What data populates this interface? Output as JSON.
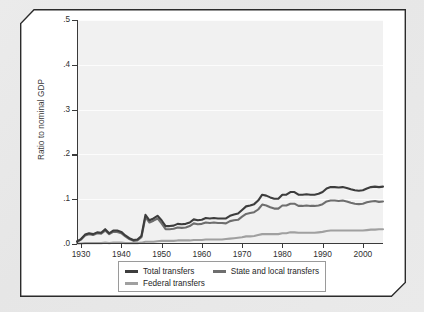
{
  "figure": {
    "ylabel": "Ratio to nominal GDP"
  },
  "legend": {
    "items": [
      {
        "label": "Total transfers",
        "color": "#3d3d3d"
      },
      {
        "label": "State and local transfers",
        "color": "#6e6e6e"
      },
      {
        "label": "Federal transfers",
        "color": "#a0a0a0"
      }
    ]
  },
  "chart_data": {
    "type": "line",
    "title": "",
    "xlabel": "",
    "ylabel": "Ratio to nominal GDP",
    "xlim": [
      1929,
      2005
    ],
    "ylim": [
      0.0,
      0.5
    ],
    "yticks": [
      0.0,
      0.1,
      0.2,
      0.3,
      0.4,
      0.5
    ],
    "ytick_labels": [
      ".0",
      ".1",
      ".2",
      ".3",
      ".4",
      ".5"
    ],
    "xticks": [
      1930,
      1940,
      1950,
      1960,
      1970,
      1980,
      1990,
      2000
    ],
    "xtick_labels": [
      "1930",
      "1940",
      "1950",
      "1960",
      "1970",
      "1980",
      "1990",
      "2000"
    ],
    "grid": true,
    "grid_axis": "y",
    "legend_position": "below",
    "x": [
      1929,
      1930,
      1931,
      1932,
      1933,
      1934,
      1935,
      1936,
      1937,
      1938,
      1939,
      1940,
      1941,
      1942,
      1943,
      1944,
      1945,
      1946,
      1947,
      1948,
      1949,
      1950,
      1951,
      1952,
      1953,
      1954,
      1955,
      1956,
      1957,
      1958,
      1959,
      1960,
      1961,
      1962,
      1963,
      1964,
      1965,
      1966,
      1967,
      1968,
      1969,
      1970,
      1971,
      1972,
      1973,
      1974,
      1975,
      1976,
      1977,
      1978,
      1979,
      1980,
      1981,
      1982,
      1983,
      1984,
      1985,
      1986,
      1987,
      1988,
      1989,
      1990,
      1991,
      1992,
      1993,
      1994,
      1995,
      1996,
      1997,
      1998,
      1999,
      2000,
      2001,
      2002,
      2003,
      2004,
      2005
    ],
    "series": [
      {
        "name": "Total transfers",
        "color": "#3d3d3d",
        "values": [
          0.006,
          0.011,
          0.021,
          0.024,
          0.022,
          0.026,
          0.025,
          0.033,
          0.024,
          0.03,
          0.03,
          0.027,
          0.019,
          0.013,
          0.009,
          0.01,
          0.018,
          0.065,
          0.053,
          0.057,
          0.063,
          0.053,
          0.04,
          0.04,
          0.041,
          0.045,
          0.044,
          0.045,
          0.048,
          0.055,
          0.053,
          0.054,
          0.058,
          0.057,
          0.058,
          0.057,
          0.057,
          0.057,
          0.063,
          0.066,
          0.068,
          0.076,
          0.084,
          0.086,
          0.089,
          0.097,
          0.11,
          0.108,
          0.104,
          0.101,
          0.101,
          0.11,
          0.11,
          0.116,
          0.116,
          0.11,
          0.11,
          0.111,
          0.11,
          0.11,
          0.112,
          0.116,
          0.124,
          0.127,
          0.127,
          0.126,
          0.127,
          0.125,
          0.122,
          0.12,
          0.119,
          0.12,
          0.124,
          0.127,
          0.128,
          0.127,
          0.128
        ]
      },
      {
        "name": "State and local transfers",
        "color": "#6e6e6e",
        "values": [
          0.005,
          0.01,
          0.019,
          0.022,
          0.02,
          0.024,
          0.023,
          0.03,
          0.022,
          0.027,
          0.027,
          0.024,
          0.017,
          0.011,
          0.007,
          0.008,
          0.015,
          0.06,
          0.048,
          0.052,
          0.057,
          0.046,
          0.033,
          0.033,
          0.034,
          0.037,
          0.036,
          0.037,
          0.04,
          0.046,
          0.044,
          0.045,
          0.048,
          0.047,
          0.048,
          0.047,
          0.047,
          0.046,
          0.051,
          0.053,
          0.054,
          0.061,
          0.067,
          0.069,
          0.071,
          0.077,
          0.088,
          0.086,
          0.082,
          0.079,
          0.079,
          0.086,
          0.086,
          0.09,
          0.09,
          0.085,
          0.085,
          0.086,
          0.085,
          0.085,
          0.086,
          0.089,
          0.095,
          0.097,
          0.097,
          0.096,
          0.097,
          0.095,
          0.092,
          0.09,
          0.089,
          0.09,
          0.093,
          0.095,
          0.096,
          0.094,
          0.095
        ]
      },
      {
        "name": "Federal transfers",
        "color": "#a0a0a0",
        "values": [
          0.001,
          0.001,
          0.002,
          0.002,
          0.002,
          0.002,
          0.002,
          0.003,
          0.002,
          0.003,
          0.003,
          0.003,
          0.002,
          0.002,
          0.002,
          0.002,
          0.003,
          0.005,
          0.005,
          0.005,
          0.006,
          0.007,
          0.007,
          0.007,
          0.007,
          0.008,
          0.008,
          0.008,
          0.008,
          0.009,
          0.009,
          0.009,
          0.01,
          0.01,
          0.01,
          0.01,
          0.01,
          0.011,
          0.012,
          0.013,
          0.014,
          0.015,
          0.017,
          0.017,
          0.018,
          0.02,
          0.022,
          0.022,
          0.022,
          0.022,
          0.022,
          0.024,
          0.024,
          0.026,
          0.026,
          0.025,
          0.025,
          0.025,
          0.025,
          0.025,
          0.026,
          0.027,
          0.029,
          0.03,
          0.03,
          0.03,
          0.03,
          0.03,
          0.03,
          0.03,
          0.03,
          0.03,
          0.031,
          0.032,
          0.032,
          0.033,
          0.033
        ]
      }
    ]
  }
}
